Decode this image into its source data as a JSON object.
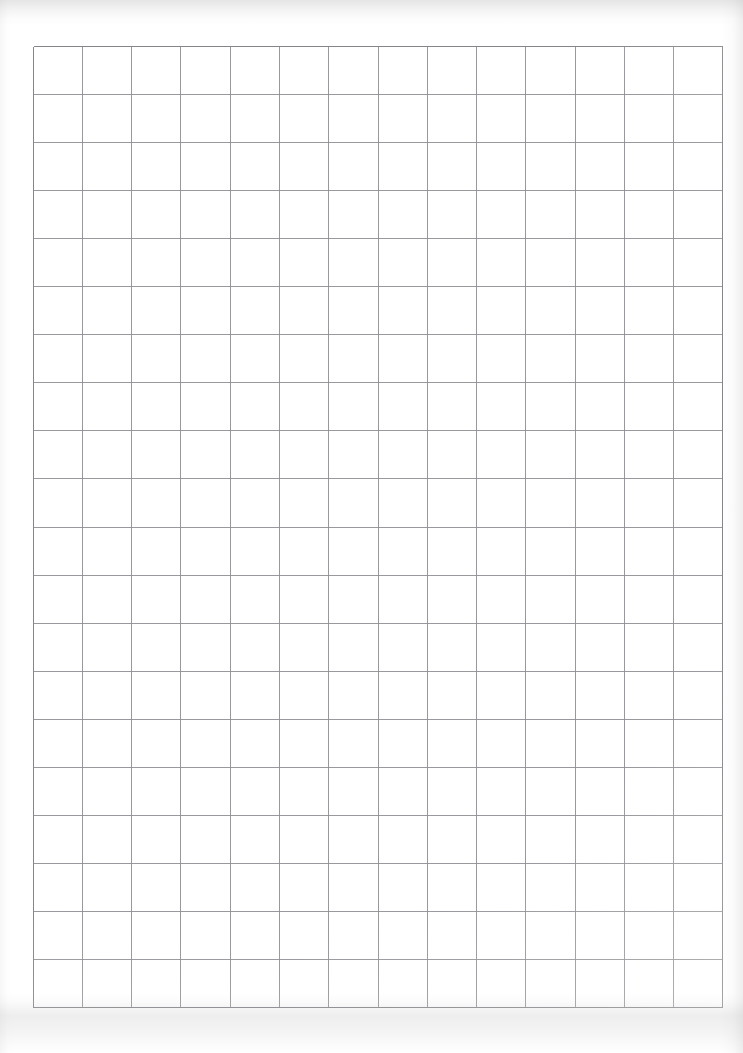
{
  "document": {
    "kind": "scanned-grid-paper",
    "page_width": 743,
    "page_height": 1053,
    "background_color": "#ffffff",
    "caption": ""
  },
  "grid": {
    "name": "graph-paper-grid",
    "columns": 14,
    "rows": 20,
    "left": 33,
    "top": 46,
    "width": 690,
    "height": 962,
    "cell_width": 49.3,
    "cell_height": 48.1,
    "line_color": "#8e8e92",
    "line_width_px": 1,
    "border_color": "#86868a",
    "x_positions": [
      0,
      49.3,
      98.6,
      147.9,
      197.1,
      246.4,
      295.7,
      345.0,
      394.3,
      443.6,
      492.9,
      542.1,
      591.4,
      640.7,
      690
    ],
    "y_positions": [
      0,
      48.1,
      96.2,
      144.3,
      192.4,
      240.5,
      288.6,
      336.7,
      384.8,
      432.9,
      481.0,
      529.1,
      577.2,
      625.3,
      673.4,
      721.5,
      769.6,
      817.7,
      865.8,
      913.9,
      962
    ]
  },
  "artifacts": {
    "top_band_label": "scanner-shadow-top",
    "bottom_band_label": "scanner-shadow-bottom",
    "right_edge_label": "page-edge-right",
    "left_edge_label": "page-edge-left"
  }
}
